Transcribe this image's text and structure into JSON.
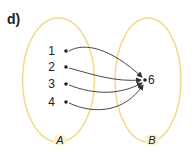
{
  "part_label": "d)",
  "colors": {
    "ellipse": "#f2d98a",
    "arrow": "#333333",
    "label_bg": "#fdf3d0",
    "text": "#222222"
  },
  "sets": [
    {
      "name": "A",
      "elements": [
        "1",
        "2",
        "3",
        "4"
      ]
    },
    {
      "name": "B",
      "elements": [
        "6"
      ]
    }
  ],
  "domain": {
    "label": "A",
    "elements": [
      {
        "value": "1"
      },
      {
        "value": "2"
      },
      {
        "value": "3"
      },
      {
        "value": "4"
      }
    ]
  },
  "codomain": {
    "label": "B",
    "elements": [
      {
        "value": "6"
      }
    ]
  },
  "mappings": [
    {
      "from": "1",
      "to": "6"
    },
    {
      "from": "2",
      "to": "6"
    },
    {
      "from": "3",
      "to": "6"
    },
    {
      "from": "4",
      "to": "6"
    }
  ]
}
